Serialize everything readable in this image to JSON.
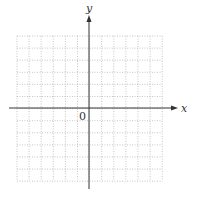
{
  "diagram": {
    "type": "coordinate-grid",
    "x_axis_label": "x",
    "y_axis_label": "y",
    "origin_label": "0",
    "grid": {
      "columns": 12,
      "rows": 12,
      "left": 17,
      "top": 36,
      "cell": 12.1,
      "line_color": "#b8b8b8"
    },
    "axes": {
      "origin_x": 89,
      "origin_y": 108,
      "x_start": 9,
      "x_end": 178,
      "y_start": 15,
      "y_end": 189,
      "color": "#333333"
    }
  }
}
